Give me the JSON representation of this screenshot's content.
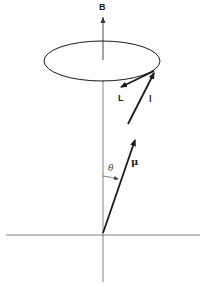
{
  "diagram": {
    "title": "",
    "labels": {
      "field": "B",
      "orbital_angular_momentum": "L",
      "spin_or_component": "l",
      "magnetic_moment": "μ",
      "angle": "θ"
    },
    "colors": {
      "ink": "#1a1a1a",
      "axis": "#555555",
      "background": "#ffffff"
    }
  }
}
